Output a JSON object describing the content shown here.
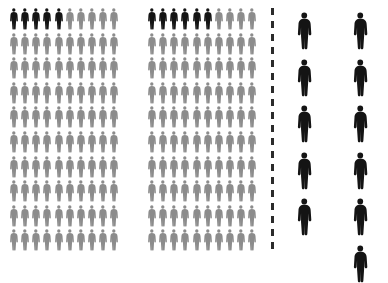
{
  "chart_data": {
    "type": "pictogram",
    "title": "",
    "subtitle": "",
    "xlabel": "",
    "ylabel": "",
    "legend": [],
    "annotations": [],
    "icon": "person-figure-icon",
    "colors": {
      "highlight": "#141414",
      "muted": "#8c8c8c",
      "background": "#ffffff",
      "divider": "#2b2b2b"
    },
    "groups": [
      {
        "name": "left-grid",
        "layout": "grid",
        "rows": 10,
        "columns": 10,
        "total": 100,
        "highlighted": 5,
        "muted": 95,
        "unit_value": 1,
        "icon_size": "small"
      },
      {
        "name": "middle-grid",
        "layout": "grid",
        "rows": 10,
        "columns": 10,
        "total": 100,
        "highlighted": 6,
        "muted": 94,
        "unit_value": 1,
        "icon_size": "small"
      },
      {
        "name": "right-column-a",
        "layout": "column",
        "rows": 5,
        "columns": 1,
        "total": 5,
        "highlighted": 5,
        "muted": 0,
        "unit_value": 1,
        "icon_size": "large"
      },
      {
        "name": "right-column-b",
        "layout": "column",
        "rows": 6,
        "columns": 1,
        "total": 6,
        "highlighted": 6,
        "muted": 0,
        "unit_value": 1,
        "icon_size": "large"
      }
    ],
    "divider": {
      "name": "dashed-vertical-divider",
      "orientation": "vertical",
      "style": "dashed"
    }
  }
}
